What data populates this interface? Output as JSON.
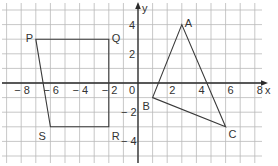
{
  "diagram": {
    "type": "coordinate-grid",
    "x_axis": {
      "label": "x",
      "min": -9,
      "max": 9,
      "ticks": [
        -8,
        -6,
        -4,
        -2,
        0,
        2,
        4,
        6,
        8
      ],
      "tick_labels": [
        "− 8",
        "− 6",
        "− 4",
        "− 2",
        "0",
        "2",
        "4",
        "6",
        "8"
      ]
    },
    "y_axis": {
      "label": "y",
      "min": -5,
      "max": 5,
      "ticks": [
        4,
        2,
        -2,
        -4
      ],
      "tick_labels": [
        "4",
        "2",
        "− 2",
        "− 4"
      ]
    },
    "shapes": [
      {
        "name": "parallelogram-PQRS",
        "vertices": [
          {
            "label": "P",
            "x": -7,
            "y": 3
          },
          {
            "label": "Q",
            "x": -2,
            "y": 3
          },
          {
            "label": "R",
            "x": -2,
            "y": -3
          },
          {
            "label": "S",
            "x": -6,
            "y": -3
          }
        ]
      },
      {
        "name": "triangle-ABC",
        "vertices": [
          {
            "label": "A",
            "x": 3,
            "y": 4
          },
          {
            "label": "B",
            "x": 1,
            "y": -1
          },
          {
            "label": "C",
            "x": 6,
            "y": -3
          }
        ]
      }
    ],
    "colors": {
      "grid": "#b9b9b9",
      "axis": "#2a2a2a",
      "shape": "#3a3a3a",
      "text": "#333333"
    }
  }
}
